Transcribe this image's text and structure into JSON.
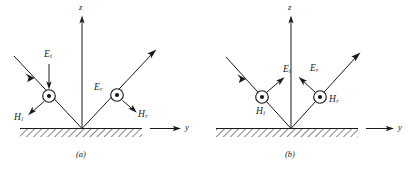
{
  "figure": {
    "stroke_color": "#1a1a1a",
    "background_color": "#ffffff",
    "hatch_color": "#2b2b2b"
  },
  "panels": [
    {
      "id": "a",
      "caption": "(a)",
      "polarization": "perpendicular",
      "axes": {
        "vertical_label": "z",
        "horizontal_label": "y"
      },
      "incident": {
        "E_label": "E",
        "E_subscript": "i",
        "H_label": "H",
        "H_subscript": "i",
        "E_symbol": "circled-dot",
        "E_direction": "out-of-page",
        "H_direction": "down-left-arrow",
        "ray_direction": "down-right"
      },
      "reflected": {
        "E_label": "E",
        "E_subscript": "r",
        "H_label": "H",
        "H_subscript": "r",
        "E_symbol": "circled-dot",
        "E_direction": "out-of-page",
        "H_direction": "down-right-arrow",
        "ray_direction": "up-right"
      }
    },
    {
      "id": "b",
      "caption": "(b)",
      "polarization": "parallel",
      "axes": {
        "vertical_label": "z",
        "horizontal_label": "y"
      },
      "incident": {
        "E_label": "E",
        "E_subscript": "i",
        "H_label": "H",
        "H_subscript": "i",
        "H_symbol": "circled-dot",
        "H_direction": "out-of-page",
        "E_direction": "up-right-arrow",
        "ray_direction": "down-right"
      },
      "reflected": {
        "E_label": "E",
        "E_subscript": "r",
        "H_label": "H",
        "H_subscript": "r",
        "H_symbol": "circled-dot",
        "H_direction": "out-of-page",
        "E_direction": "up-left-arrow",
        "ray_direction": "up-right"
      }
    }
  ]
}
